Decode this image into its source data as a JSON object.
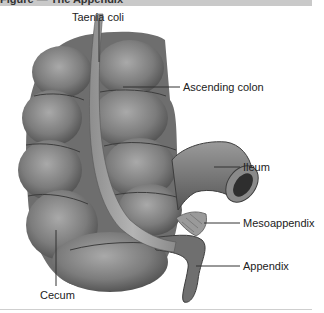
{
  "figure": {
    "header_text": "Figure — The Appendix",
    "labels": {
      "taenia_coli": "Taenia coli",
      "ascending_colon": "Ascending colon",
      "ileum": "Ileum",
      "mesoappendix": "Mesoappendix",
      "appendix": "Appendix",
      "cecum": "Cecum"
    },
    "colors": {
      "header_bar": "#c9c9c9",
      "colon_fill": "#7a7a7a",
      "colon_highlight": "#a8a8a8",
      "colon_shadow": "#4a4a4a",
      "leader_line": "#333333",
      "footer_line": "#cfcfcf"
    }
  }
}
